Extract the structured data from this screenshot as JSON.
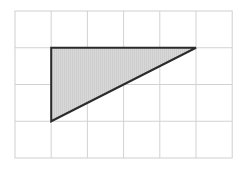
{
  "figure": {
    "canvas": {
      "width": 244,
      "height": 169,
      "background": "#ffffff"
    },
    "grid": {
      "origin_x": 15,
      "origin_y": 11,
      "columns": 6,
      "rows": 4,
      "cell_width": 36.2,
      "cell_height": 36.75,
      "line_color": "#d2d2d2",
      "line_width": 1,
      "border_color": "#cfcfcf",
      "border_width": 1,
      "visible": true
    },
    "shape": {
      "type": "triangle",
      "name": "right-triangle",
      "fill_color": "#d6d6d6",
      "stroke_color": "#2b2b2b",
      "stroke_width": 2,
      "hatch_color": "#c6c6c6",
      "hatch_pattern": "vertical-lines",
      "vertices_grid": [
        {
          "label": "top-left",
          "col": 1,
          "row": 1
        },
        {
          "label": "top-right",
          "col": 5,
          "row": 1
        },
        {
          "label": "bottom-left",
          "col": 1,
          "row": 3
        }
      ],
      "vertices_px": [
        {
          "label": "top-left",
          "x": 51.2,
          "y": 47.75
        },
        {
          "label": "top-right",
          "x": 196.0,
          "y": 47.75
        },
        {
          "label": "bottom-left",
          "x": 51.2,
          "y": 121.25
        }
      ],
      "base_cells": 4,
      "height_cells": 2
    }
  }
}
